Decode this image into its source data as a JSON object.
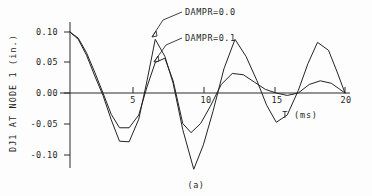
{
  "figure": {
    "caption": "(a)",
    "y_axis_title": "DJ1 AT NODE 1  (in.)",
    "x_axis_title": "T  (ms)"
  },
  "chart_data": {
    "type": "line",
    "title": "",
    "subtitle": "",
    "xlabel": "T  (ms)",
    "ylabel": "DJ1 AT NODE 1  (in.)",
    "xlim": [
      0,
      21
    ],
    "ylim": [
      -0.135,
      0.115
    ],
    "xticks": [
      5,
      10,
      15,
      20
    ],
    "xtick_labels": [
      "5",
      "10",
      "15",
      "20"
    ],
    "yticks": [
      0.1,
      0.05,
      0.0,
      -0.05,
      -0.1
    ],
    "ytick_labels": [
      "0.10",
      "0.05",
      "0.00",
      "-0.05",
      "-0.10"
    ],
    "grid": false,
    "legend": "annotations",
    "annotations": [
      {
        "text": "DAMPR=0.0",
        "points_to_series": "DAMPR=0.0",
        "x": 6.0,
        "y": 0.082
      },
      {
        "text": "DAMPR=0.1",
        "points_to_series": "DAMPR=0.1",
        "x": 6.3,
        "y": 0.046
      }
    ],
    "series": [
      {
        "name": "DAMPR=0.0",
        "x": [
          0.0,
          0.6,
          1.2,
          1.8,
          2.4,
          3.0,
          3.6,
          4.3,
          5.0,
          5.6,
          6.2,
          6.9,
          7.5,
          8.2,
          9.0,
          9.7,
          10.4,
          11.2,
          12.0,
          12.8,
          13.6,
          14.3,
          15.0,
          15.8,
          16.6,
          17.3,
          18.0,
          18.8,
          19.4,
          20.0
        ],
        "y": [
          0.1,
          0.088,
          0.062,
          0.028,
          -0.004,
          -0.044,
          -0.079,
          -0.08,
          -0.043,
          0.02,
          0.088,
          0.06,
          0.016,
          -0.06,
          -0.125,
          -0.085,
          -0.03,
          0.04,
          0.088,
          0.06,
          0.02,
          -0.02,
          -0.048,
          -0.036,
          0.004,
          0.048,
          0.083,
          0.07,
          0.036,
          0.0
        ]
      },
      {
        "name": "DAMPR=0.1",
        "x": [
          0.0,
          0.6,
          1.2,
          1.8,
          2.4,
          3.0,
          3.6,
          4.3,
          5.0,
          5.6,
          6.2,
          6.9,
          7.5,
          8.2,
          8.8,
          9.5,
          10.2,
          11.0,
          11.8,
          12.6,
          13.4,
          14.2,
          15.0,
          15.8,
          16.6,
          17.4,
          18.2,
          19.0,
          19.5,
          20.0
        ],
        "y": [
          0.1,
          0.09,
          0.066,
          0.034,
          0.0,
          -0.035,
          -0.057,
          -0.057,
          -0.036,
          0.01,
          0.05,
          0.057,
          0.02,
          -0.05,
          -0.065,
          -0.05,
          -0.022,
          0.014,
          0.032,
          0.03,
          0.018,
          0.006,
          0.0,
          -0.004,
          0.0,
          0.014,
          0.02,
          0.016,
          0.008,
          0.0
        ]
      }
    ]
  }
}
